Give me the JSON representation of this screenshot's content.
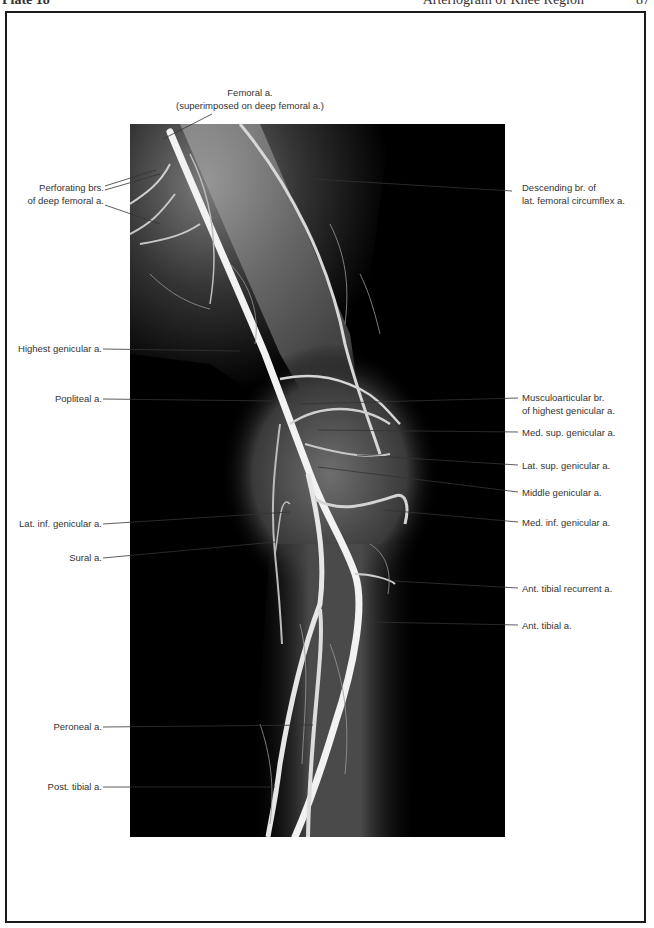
{
  "header": {
    "plate": "Plate 18",
    "title": "Arteriogram of Knee Region",
    "page": "87"
  },
  "figure": {
    "type": "arteriogram",
    "background": "#000000",
    "labels_left": [
      {
        "id": "perforating",
        "lines": [
          "Perforating brs.",
          "of deep femoral a."
        ]
      },
      {
        "id": "highest-genicular",
        "lines": [
          "Highest genicular a."
        ]
      },
      {
        "id": "popliteal",
        "lines": [
          "Popliteal a."
        ]
      },
      {
        "id": "lat-inf-genicular",
        "lines": [
          "Lat. inf. genicular a."
        ]
      },
      {
        "id": "sural",
        "lines": [
          "Sural a."
        ]
      },
      {
        "id": "peroneal",
        "lines": [
          "Peroneal a."
        ]
      },
      {
        "id": "post-tibial",
        "lines": [
          "Post. tibial a."
        ]
      }
    ],
    "labels_top": [
      {
        "id": "femoral",
        "lines": [
          "Femoral a.",
          "(superimposed on deep femoral a.)"
        ]
      }
    ],
    "labels_right": [
      {
        "id": "descending-br",
        "lines": [
          "Descending br. of",
          "lat. femoral circumflex a."
        ]
      },
      {
        "id": "musculoarticular",
        "lines": [
          "Musculoarticular br.",
          "of highest genicular a."
        ]
      },
      {
        "id": "med-sup-genicular",
        "lines": [
          "Med. sup. genicular a."
        ]
      },
      {
        "id": "lat-sup-genicular",
        "lines": [
          "Lat. sup. genicular a."
        ]
      },
      {
        "id": "middle-genicular",
        "lines": [
          "Middle genicular a."
        ]
      },
      {
        "id": "med-inf-genicular",
        "lines": [
          "Med. inf. genicular a."
        ]
      },
      {
        "id": "ant-tibial-recurrent",
        "lines": [
          "Ant. tibial recurrent a."
        ]
      },
      {
        "id": "ant-tibial",
        "lines": [
          "Ant. tibial a."
        ]
      }
    ]
  }
}
